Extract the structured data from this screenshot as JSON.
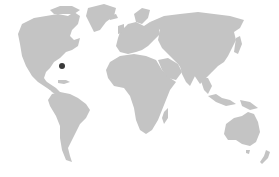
{
  "map": {
    "title": "World map",
    "land_color": "#c4c4c4",
    "background_color": "#ffffff",
    "marker_color": "#3a3a3a",
    "markers": [
      {
        "name": "location-marker",
        "x": 62,
        "y": 66,
        "radius": 3
      }
    ],
    "continents": [
      "North America",
      "Greenland",
      "South America",
      "Europe",
      "Africa",
      "Asia",
      "Australia",
      "New Zealand",
      "Madagascar"
    ]
  }
}
